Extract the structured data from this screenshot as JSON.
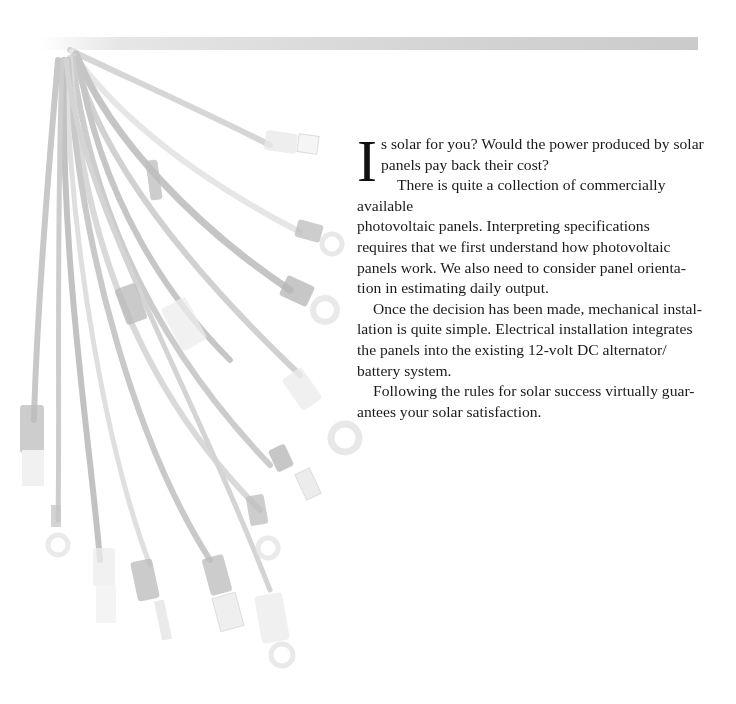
{
  "page": {
    "decorative_band": "top-gray-band",
    "illustration": {
      "subject": "wire-harness-with-crimp-connectors",
      "connector_types": [
        "spade",
        "ring",
        "butt",
        "quick-disconnect",
        "pin"
      ],
      "tone": "faded-grayscale"
    }
  },
  "intro": {
    "drop_cap": "I",
    "paragraphs": [
      {
        "lines": [
          "s solar for you? Would the power produced by solar",
          "panels pay back their cost?"
        ]
      },
      {
        "lines": [
          "There is quite a collection of commercially available",
          "photovoltaic panels. Interpreting specifications",
          "requires that we first understand how photovoltaic",
          "panels work. We also need to consider panel orienta-",
          "tion in estimating daily output."
        ]
      },
      {
        "lines": [
          "Once the decision has been made, mechanical instal-",
          "lation is quite simple. Electrical installation integrates",
          "the panels into the existing 12-volt DC alternator/",
          "battery system."
        ]
      },
      {
        "lines": [
          "Following the rules for solar success virtually guar-",
          "antees your solar satisfaction."
        ]
      }
    ]
  }
}
